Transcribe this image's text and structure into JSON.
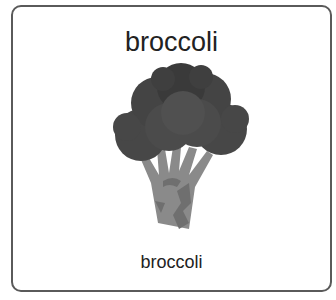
{
  "card": {
    "title": "broccoli",
    "label": "broccoli",
    "image": "broccoli-illustration"
  },
  "colors": {
    "border": "#5a5a5a",
    "text": "#222222",
    "floret_dark": "#3f3f3f",
    "floret_mid": "#4a4a4a",
    "stem": "#8a8a8a",
    "stem_shade": "#6f6f6f"
  }
}
